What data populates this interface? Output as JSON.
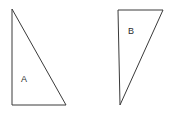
{
  "canvas": {
    "width": 169,
    "height": 113,
    "background_color": "#ffffff"
  },
  "style": {
    "stroke_color": "#3a3a3a",
    "stroke_width": 1,
    "fill_color": "#ffffff",
    "label_color": "#2b2b2b",
    "label_font_size": 9
  },
  "shapes": [
    {
      "id": "triangle-a",
      "label": "A",
      "type": "right-triangle",
      "right_angle_corner": "bottom-left",
      "points": "12,9 12,105 66,105",
      "vertices": [
        {
          "name": "apex-top",
          "x": 12,
          "y": 9
        },
        {
          "name": "bottom-left",
          "x": 12,
          "y": 105
        },
        {
          "name": "bottom-right",
          "x": 66,
          "y": 105
        }
      ],
      "label_position": {
        "x": 24,
        "y": 80
      }
    },
    {
      "id": "triangle-b",
      "label": "B",
      "type": "right-triangle",
      "right_angle_corner": "top-left",
      "points": "118,10 163,10 120,105",
      "vertices": [
        {
          "name": "top-left",
          "x": 118,
          "y": 10
        },
        {
          "name": "top-right",
          "x": 163,
          "y": 10
        },
        {
          "name": "apex-bottom",
          "x": 120,
          "y": 105
        }
      ],
      "label_position": {
        "x": 131,
        "y": 32
      }
    }
  ]
}
